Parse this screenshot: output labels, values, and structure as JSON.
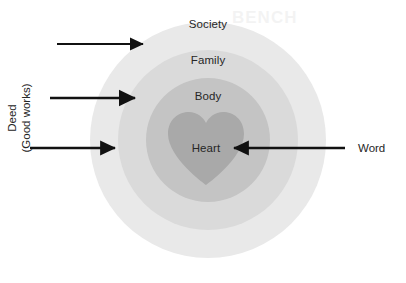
{
  "diagram": {
    "type": "concentric-circles",
    "center": {
      "x": 208,
      "y": 140
    },
    "rings": [
      {
        "key": "society",
        "label": "Society",
        "radius": 118,
        "color": "#e9e9e9",
        "label_y": 24
      },
      {
        "key": "family",
        "label": "Family",
        "radius": 90,
        "color": "#dadada",
        "label_y": 60
      },
      {
        "key": "body",
        "label": "Body",
        "radius": 62,
        "color": "#c4c4c4",
        "label_y": 96
      },
      {
        "key": "heart",
        "label": "Heart",
        "radius": 38,
        "color": "#a9a9a9",
        "label_y": 148
      }
    ],
    "center_shape": "heart",
    "annotations": {
      "left": {
        "label_lines": [
          "Deed",
          "(Good works)"
        ],
        "direction": "inward-right",
        "arrow_count": 3,
        "arrows": [
          {
            "target_ring": "society",
            "x_start": 57,
            "x_end": 145,
            "y": 44
          },
          {
            "target_ring": "family",
            "x_start": 50,
            "x_end": 137,
            "y": 98
          },
          {
            "target_ring": "body",
            "x_start": 30,
            "x_end": 118,
            "y": 148
          }
        ]
      },
      "right": {
        "label": "Word",
        "direction": "inward-left",
        "arrow_count": 1,
        "arrows": [
          {
            "target_ring": "heart",
            "x_start": 345,
            "x_end": 232,
            "y": 148
          }
        ]
      }
    },
    "watermark_top": "BENCH",
    "colors": {
      "arrow": "#111111",
      "text": "#262626",
      "background": "#ffffff"
    }
  }
}
